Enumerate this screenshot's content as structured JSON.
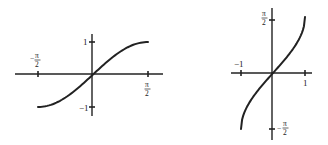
{
  "chart_data": [
    {
      "type": "line",
      "title": "",
      "function": "sin(x)",
      "xlabel": "",
      "ylabel": "",
      "xlim": [
        -1.5708,
        1.5708
      ],
      "ylim": [
        -1,
        1
      ],
      "x_tick_labels": [
        "-π/2",
        "π/2"
      ],
      "y_tick_labels": [
        "1",
        "-1"
      ],
      "grid": false,
      "series": [
        {
          "name": "sin x",
          "x": [
            -1.5708,
            -1.1781,
            -0.7854,
            -0.3927,
            0,
            0.3927,
            0.7854,
            1.1781,
            1.5708
          ],
          "y": [
            -1,
            -0.9239,
            -0.7071,
            -0.3827,
            0,
            0.3827,
            0.7071,
            0.9239,
            1
          ]
        }
      ]
    },
    {
      "type": "line",
      "title": "",
      "function": "arcsin(x)",
      "xlabel": "",
      "ylabel": "",
      "xlim": [
        -1,
        1
      ],
      "ylim": [
        -1.5708,
        1.5708
      ],
      "x_tick_labels": [
        "-1",
        "1"
      ],
      "y_tick_labels": [
        "π/2",
        "-π/2"
      ],
      "grid": false,
      "series": [
        {
          "name": "arcsin x",
          "x": [
            -1,
            -0.9239,
            -0.7071,
            -0.3827,
            0,
            0.3827,
            0.7071,
            0.9239,
            1
          ],
          "y": [
            -1.5708,
            -1.1781,
            -0.7854,
            -0.3927,
            0,
            0.3927,
            0.7854,
            1.1781,
            1.5708
          ]
        }
      ]
    }
  ],
  "labels": {
    "left": {
      "neg_x": {
        "sign": "−",
        "num": "π",
        "den": "2"
      },
      "pos_x": {
        "num": "π",
        "den": "2"
      },
      "pos_y": "1",
      "neg_y": "−1"
    },
    "right": {
      "neg_x": "−1",
      "pos_x": "1",
      "pos_y": {
        "num": "π",
        "den": "2"
      },
      "neg_y": {
        "sign": "−",
        "num": "π",
        "den": "2"
      }
    }
  }
}
